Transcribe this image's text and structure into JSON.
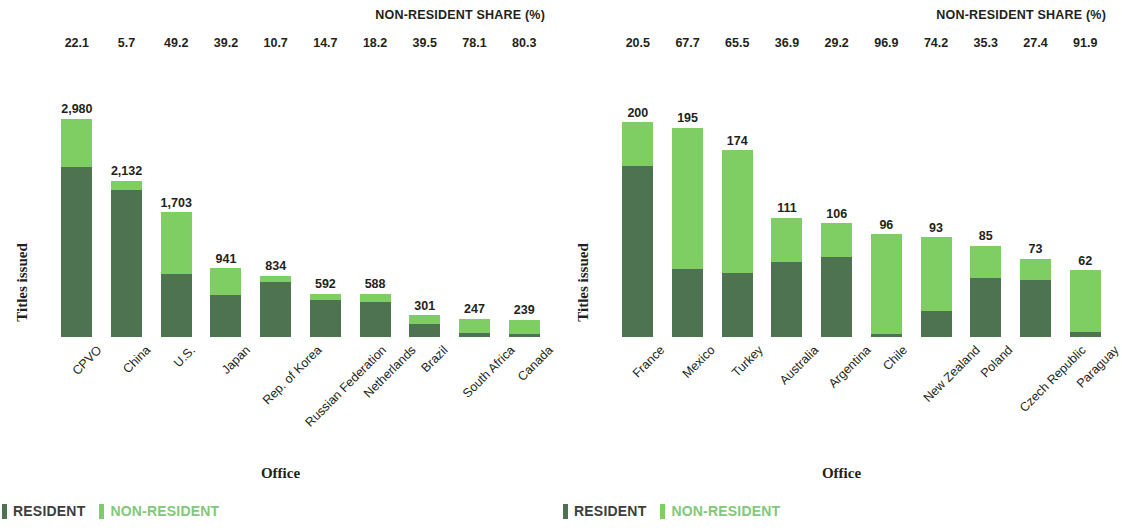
{
  "colors": {
    "resident": "#4e7350",
    "non_resident": "#7ece64",
    "text": "#231f20",
    "legend_non_resident_text": "#82c878"
  },
  "panels": [
    {
      "share_header": "NON-RESIDENT SHARE (%)",
      "ylabel": "Titles issued",
      "xlabel": "Office",
      "legend": {
        "resident": "RESIDENT",
        "non_resident": "NON-RESIDENT"
      },
      "chart_data": {
        "type": "bar",
        "stacked": true,
        "title": "",
        "xlabel": "Office",
        "ylabel": "Titles issued",
        "ylim": [
          0,
          3000
        ],
        "grid": false,
        "legend_position": "bottom-left",
        "categories": [
          "CPVO",
          "China",
          "U.S.",
          "Japan",
          "Rep. of Korea",
          "Russian Federation",
          "Netherlands",
          "Brazil",
          "South Africa",
          "Canada"
        ],
        "totals": [
          "2,980",
          "2,132",
          "1,703",
          "941",
          "834",
          "592",
          "588",
          "301",
          "247",
          "239"
        ],
        "totals_numeric": [
          2980,
          2132,
          1703,
          941,
          834,
          592,
          588,
          301,
          247,
          239
        ],
        "non_resident_share_pct": [
          22.1,
          5.7,
          49.2,
          39.2,
          10.7,
          14.7,
          18.2,
          39.5,
          78.1,
          80.3
        ],
        "series": [
          {
            "name": "RESIDENT",
            "values": [
              2321,
              2010,
              865,
              572,
              745,
              505,
              481,
              182,
              54,
              47
            ]
          },
          {
            "name": "NON-RESIDENT",
            "values": [
              659,
              122,
              838,
              369,
              89,
              87,
              107,
              119,
              193,
              192
            ]
          }
        ]
      }
    },
    {
      "share_header": "NON-RESIDENT SHARE (%)",
      "ylabel": "Titles issued",
      "xlabel": "Office",
      "legend": {
        "resident": "RESIDENT",
        "non_resident": "NON-RESIDENT"
      },
      "chart_data": {
        "type": "bar",
        "stacked": true,
        "title": "",
        "xlabel": "Office",
        "ylabel": "Titles issued",
        "ylim": [
          0,
          205
        ],
        "grid": false,
        "legend_position": "bottom-left",
        "categories": [
          "France",
          "Mexico",
          "Turkey",
          "Australia",
          "Argentina",
          "Chile",
          "New Zealand",
          "Poland",
          "Czech Republic",
          "Paraguay"
        ],
        "totals": [
          "200",
          "195",
          "174",
          "111",
          "106",
          "96",
          "93",
          "85",
          "73",
          "62"
        ],
        "totals_numeric": [
          200,
          195,
          174,
          111,
          106,
          96,
          93,
          85,
          73,
          62
        ],
        "non_resident_share_pct": [
          20.5,
          67.7,
          65.5,
          36.9,
          29.2,
          96.9,
          74.2,
          35.3,
          27.4,
          91.9
        ],
        "series": [
          {
            "name": "RESIDENT",
            "values": [
              159,
              63,
              60,
              70,
              75,
              3,
              24,
              55,
              53,
              5
            ]
          },
          {
            "name": "NON-RESIDENT",
            "values": [
              41,
              132,
              114,
              41,
              31,
              93,
              69,
              30,
              20,
              57
            ]
          }
        ]
      }
    }
  ]
}
